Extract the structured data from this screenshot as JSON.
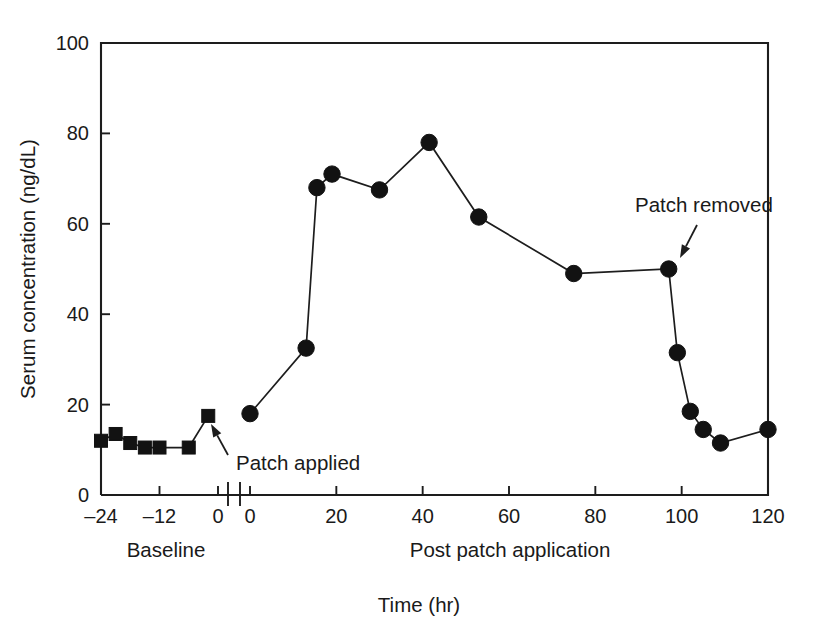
{
  "chart_data": {
    "type": "line",
    "title": "",
    "xlabel": "Time (hr)",
    "ylabel": "Serum concentration (ng/dL)",
    "ylim": [
      0,
      100
    ],
    "yticks": [
      0,
      20,
      40,
      60,
      80,
      100
    ],
    "ytick_labels": [
      "0",
      "20",
      "40",
      "60",
      "80",
      "100"
    ],
    "grid": false,
    "legend": "none",
    "axis_break": true,
    "segments": [
      {
        "name": "Baseline",
        "group_label": "Baseline",
        "marker": "square",
        "xlim": [
          -24,
          0
        ],
        "xticks": [
          -24,
          -12,
          0
        ],
        "xtick_labels": [
          "–24",
          "–12",
          "0"
        ],
        "x": [
          -24,
          -21,
          -18,
          -15,
          -12,
          -6,
          -2
        ],
        "y": [
          12.0,
          13.5,
          11.5,
          10.5,
          10.5,
          10.5,
          17.5
        ]
      },
      {
        "name": "Post patch application",
        "group_label": "Post patch application",
        "marker": "circle",
        "xlim": [
          0,
          120
        ],
        "xticks": [
          0,
          20,
          40,
          60,
          80,
          100,
          120
        ],
        "xtick_labels": [
          "0",
          "20",
          "40",
          "60",
          "80",
          "100",
          "120"
        ],
        "x": [
          0,
          13,
          15.5,
          19,
          30,
          41.5,
          53,
          75,
          97,
          99,
          102,
          105,
          109,
          120
        ],
        "y": [
          18.0,
          32.5,
          68.0,
          71.0,
          67.5,
          78.0,
          61.5,
          49.0,
          50.0,
          31.5,
          18.5,
          14.5,
          11.5,
          14.5
        ]
      }
    ],
    "annotations": [
      {
        "name": "patch-applied",
        "text": "Patch applied",
        "text_x": 236,
        "text_y": 470,
        "anchor": "start",
        "arrow_from_x": 228,
        "arrow_from_y": 455,
        "arrow_to_x": 211,
        "arrow_to_y": 424
      },
      {
        "name": "patch-removed",
        "text": "Patch removed",
        "text_x": 635,
        "text_y": 212,
        "anchor": "start",
        "arrow_from_x": 697,
        "arrow_from_y": 225,
        "arrow_to_x": 680,
        "arrow_to_y": 258
      }
    ]
  },
  "colors": {
    "ink": "#1d1d1d",
    "marker": "#121212",
    "background": "#ffffff"
  }
}
